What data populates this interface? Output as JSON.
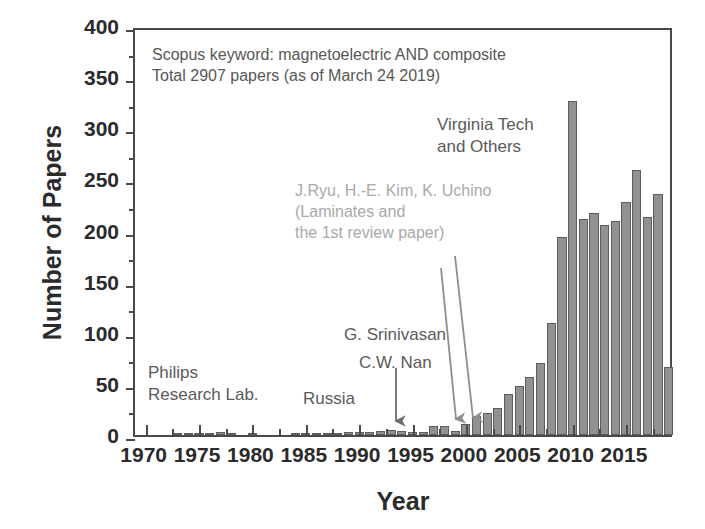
{
  "chart_data": {
    "type": "bar",
    "title": "",
    "xlabel": "Year",
    "ylabel": "Number of Papers",
    "xlim": [
      1969,
      2019.5
    ],
    "ylim": [
      0,
      400
    ],
    "yticks": [
      0,
      50,
      100,
      150,
      200,
      250,
      300,
      350,
      400
    ],
    "xticks": [
      1970,
      1975,
      1980,
      1985,
      1990,
      1995,
      2000,
      2005,
      2010,
      2015
    ],
    "grid": false,
    "legend": "none",
    "bar_color": "#919191",
    "bar_edge_color": "#5d5d5d",
    "categories": [
      1970,
      1971,
      1972,
      1973,
      1974,
      1975,
      1976,
      1977,
      1978,
      1979,
      1980,
      1981,
      1982,
      1983,
      1984,
      1985,
      1986,
      1987,
      1988,
      1989,
      1990,
      1991,
      1992,
      1993,
      1994,
      1995,
      1996,
      1997,
      1998,
      1999,
      2000,
      2001,
      2002,
      2003,
      2004,
      2005,
      2006,
      2007,
      2008,
      2009,
      2010,
      2011,
      2012,
      2013,
      2014,
      2015,
      2016,
      2017,
      2018,
      2019
    ],
    "values": [
      0,
      0,
      0,
      2,
      2,
      2,
      1,
      3,
      2,
      0,
      1,
      0,
      0,
      0,
      1,
      2,
      1,
      2,
      2,
      3,
      3,
      3,
      4,
      5,
      4,
      3,
      3,
      9,
      9,
      4,
      11,
      19,
      22,
      26,
      40,
      48,
      57,
      70,
      110,
      194,
      327,
      211,
      217,
      205,
      209,
      228,
      259,
      213,
      236,
      248
    ],
    "last_bar_value": 67,
    "annotations": [
      {
        "name": "scopus-note",
        "line1": "Scopus keyword: magnetoelectric AND composite",
        "line2": "Total 2907 papers (as of March 24 2019)"
      },
      {
        "name": "virginia-tech",
        "line1": "Virginia Tech",
        "line2": "and Others"
      },
      {
        "name": "ryu-kim-uchino",
        "line1": "J.Ryu, H.-E. Kim, K. Uchino",
        "line2": "(Laminates and",
        "line3": "the 1st review paper)"
      },
      {
        "name": "srinivasan",
        "line1": "G. Srinivasan"
      },
      {
        "name": "cw-nan",
        "line1": "C.W. Nan"
      },
      {
        "name": "philips",
        "line1": "Philips",
        "line2": "Research Lab."
      },
      {
        "name": "russia",
        "line1": "Russia"
      }
    ]
  },
  "axes": {
    "y_title": "Number of Papers",
    "x_title": "Year",
    "y_tick_labels": [
      "0",
      "50",
      "100",
      "150",
      "200",
      "250",
      "300",
      "350",
      "400"
    ],
    "x_tick_labels": [
      "1970",
      "1975",
      "1980",
      "1985",
      "1990",
      "1995",
      "2000",
      "2005",
      "2010",
      "2015"
    ]
  },
  "notes": {
    "scopus_line1": "Scopus keyword: magnetoelectric AND composite",
    "scopus_line2": "Total 2907 papers (as of March 24 2019)",
    "vt_line1": "Virginia Tech",
    "vt_line2": "and Others",
    "ryu_line1": "J.Ryu, H.-E. Kim, K. Uchino",
    "ryu_line2": "(Laminates and",
    "ryu_line3": "the 1st review paper)",
    "srinivasan": "G. Srinivasan",
    "nan": "C.W. Nan",
    "philips_line1": "Philips",
    "philips_line2": "Research Lab.",
    "russia": "Russia"
  }
}
